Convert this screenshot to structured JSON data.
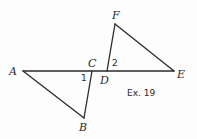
{
  "figure": {
    "caption": "Ex. 19",
    "points": {
      "A": {
        "label": "A",
        "x": 23,
        "y": 71
      },
      "B": {
        "label": "B",
        "x": 84,
        "y": 118
      },
      "C": {
        "label": "C",
        "x": 92,
        "y": 71
      },
      "D": {
        "label": "D",
        "x": 107,
        "y": 71
      },
      "E": {
        "label": "E",
        "x": 174,
        "y": 71
      },
      "F": {
        "label": "F",
        "x": 115,
        "y": 24
      }
    },
    "angles": {
      "angle1": {
        "label": "1"
      },
      "angle2": {
        "label": "2"
      }
    },
    "segments": [
      {
        "from": "A",
        "to": "E",
        "name": "line-AE"
      },
      {
        "from": "A",
        "to": "B",
        "name": "segment-AB"
      },
      {
        "from": "C",
        "to": "B",
        "name": "segment-CB"
      },
      {
        "from": "D",
        "to": "F",
        "name": "segment-DF"
      },
      {
        "from": "F",
        "to": "E",
        "name": "segment-FE"
      }
    ],
    "stroke_color": "#2a2a2a"
  }
}
